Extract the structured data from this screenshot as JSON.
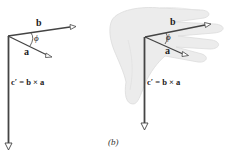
{
  "figure": {
    "caption": "(b)",
    "left_diagram": {
      "vector_b_label": "b",
      "vector_a_label": "a",
      "angle_label": "ϕ",
      "vector_c_label": "c′ = b × a"
    },
    "right_diagram": {
      "vector_b_label": "b",
      "vector_a_label": "a",
      "angle_label": "ϕ",
      "vector_c_label": "c′ = b × a",
      "background": "right-hand"
    }
  },
  "colors": {
    "vector": "#444444",
    "hand": "#e8e8e8",
    "hand_shadow": "#d6d6d6"
  }
}
